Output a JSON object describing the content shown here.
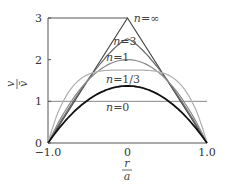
{
  "chart_data": {
    "type": "line",
    "title": "",
    "xlabel": "r/a",
    "ylabel": "v/v̄",
    "xlim": [
      -1.0,
      1.0
    ],
    "ylim": [
      0,
      3
    ],
    "x_ticks": [
      "-1.0",
      "0",
      "1.0"
    ],
    "y_ticks": [
      "0",
      "1",
      "2",
      "3"
    ],
    "grid": false,
    "reference_line": {
      "y": 1,
      "color": "#888888"
    },
    "series": [
      {
        "name": "n=∞",
        "n": "inf",
        "peak": 3.0,
        "exponent": 1,
        "color": "#444444",
        "width": 1.2,
        "shape": "triangle"
      },
      {
        "name": "n=3",
        "n": 3,
        "peak": 2.5,
        "exponent": 1.333,
        "color": "#666666",
        "width": 1.2
      },
      {
        "name": "n=1",
        "n": 1,
        "peak": 2.0,
        "exponent": 2,
        "color": "#888888",
        "width": 1.2
      },
      {
        "name": "n=1/3",
        "n": 0.333,
        "peak": 1.75,
        "exponent": 4,
        "color": "#b0b0b0",
        "width": 1.2
      },
      {
        "name": "n=0",
        "n": 0,
        "peak": 1.37,
        "exponent": 2,
        "color": "#111111",
        "width": 1.8
      }
    ],
    "annotations": [
      {
        "text": "n=∞",
        "x": 0.08,
        "y": 2.9
      },
      {
        "text": "n=3",
        "x": -0.18,
        "y": 2.35
      },
      {
        "text": "n=1",
        "x": -0.27,
        "y": 1.98
      },
      {
        "text": "n=1/3",
        "x": -0.27,
        "y": 1.45
      },
      {
        "text": "n=0",
        "x": -0.27,
        "y": 0.78
      }
    ]
  },
  "axes": {
    "y_label_num": "v",
    "y_label_den": "v̄",
    "x_label_num": "r",
    "x_label_den": "a"
  }
}
